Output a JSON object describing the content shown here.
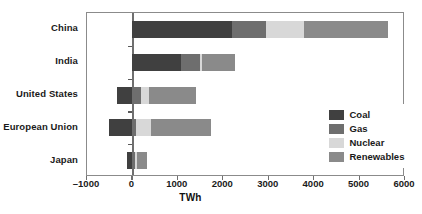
{
  "chart_data": {
    "type": "bar",
    "orientation": "horizontal",
    "stacked": true,
    "title": "",
    "xlabel": "TWh",
    "ylabel": "",
    "xlim": [
      -1000,
      6000
    ],
    "xticks": [
      -1000,
      0,
      1000,
      2000,
      3000,
      4000,
      5000,
      6000
    ],
    "xticklabels": [
      "–1000",
      "0",
      "1000",
      "2000",
      "3000",
      "4000",
      "5000",
      "6000"
    ],
    "grid": false,
    "legend_position": "right-inside",
    "categories": [
      "China",
      "India",
      "United States",
      "European Union",
      "Japan"
    ],
    "series": [
      {
        "name": "Coal",
        "color": "#404040",
        "values": [
          2200,
          1080,
          -330,
          -510,
          -110
        ]
      },
      {
        "name": "Gas",
        "color": "#6e6e6e",
        "values": [
          730,
          400,
          180,
          90,
          60
        ]
      },
      {
        "name": "Nuclear",
        "color": "#d8d8d8",
        "values": [
          840,
          60,
          190,
          320,
          40
        ]
      },
      {
        "name": "Renewables",
        "color": "#8a8a8a",
        "values": [
          1850,
          720,
          1020,
          1330,
          230
        ]
      }
    ]
  },
  "legend": {
    "entries": [
      {
        "label": "Coal",
        "color": "#404040"
      },
      {
        "label": "Gas",
        "color": "#6e6e6e"
      },
      {
        "label": "Nuclear",
        "color": "#d8d8d8"
      },
      {
        "label": "Renewables",
        "color": "#8a8a8a"
      }
    ]
  }
}
